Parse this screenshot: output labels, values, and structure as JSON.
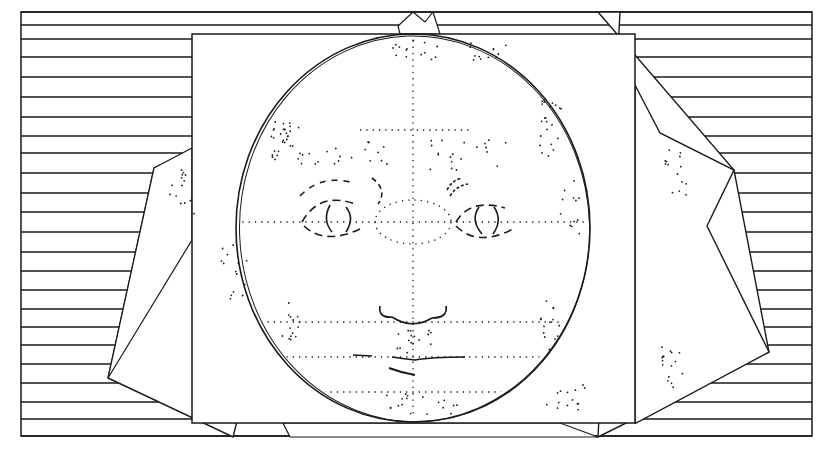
{
  "figure": {
    "ink_color": "#1a1a1a",
    "paper_color": "#ffffff",
    "frame": {
      "left": 21,
      "top": 12,
      "right": 812,
      "bottom": 436
    },
    "stripe_ys": [
      12,
      25,
      39,
      57,
      77,
      97,
      117,
      136,
      153,
      173,
      193,
      212,
      232,
      252,
      271,
      290,
      309,
      327,
      345,
      364,
      383,
      402,
      419,
      436
    ],
    "center_card": {
      "x": 192,
      "y": 34,
      "width": 443,
      "height": 389
    },
    "face_oval": {
      "cx": 413,
      "cy": 228,
      "rx": 177,
      "ry": 194
    },
    "guidelines": {
      "vertical_x": 413,
      "eye_line_y": 222,
      "nose_line_y": 322,
      "mouth_line_y": 357,
      "chin_line_y": 392,
      "brow_line_y": 130
    }
  }
}
